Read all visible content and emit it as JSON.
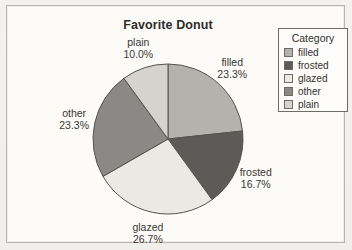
{
  "chart_data": {
    "type": "pie",
    "title": "Favorite Donut",
    "categories": [
      "filled",
      "frosted",
      "glazed",
      "other",
      "plain"
    ],
    "values": [
      23.3,
      16.7,
      26.7,
      23.3,
      10.0
    ],
    "percent_labels": [
      "23.3%",
      "16.7%",
      "26.7%",
      "23.3%",
      "10.0%"
    ],
    "colors": [
      "#b5b2ae",
      "#5d5b58",
      "#ebe9e4",
      "#8b8985",
      "#d6d3cf"
    ],
    "slice_stroke": "#55534f",
    "start_angle": "top",
    "direction": "clockwise",
    "legend": {
      "title": "Category",
      "position": "right",
      "entries": [
        "filled",
        "frosted",
        "glazed",
        "other",
        "plain"
      ]
    }
  }
}
